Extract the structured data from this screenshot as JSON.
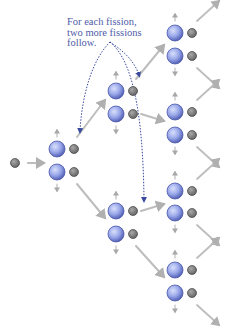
{
  "annotation": {
    "lines": [
      "For each fission,",
      "two more fissions",
      "follow."
    ],
    "color": "#4f5ca8"
  },
  "colors": {
    "nucleus_light": "#c9d3f7",
    "nucleus_mid": "#8e9ee6",
    "nucleus_dark": "#5563b8",
    "neutron_fill": "#7a7a7a",
    "neutron_stroke": "#4a4a4a",
    "arrow": "#b4b4b4",
    "dotted_arrow": "#3a4a9e"
  },
  "diagram": {
    "initial_neutron": {
      "x": 15,
      "y": 163
    },
    "stages": [
      {
        "name": "stage-1",
        "pairs": [
          {
            "x": 57,
            "y1": 149,
            "y2": 172
          }
        ]
      },
      {
        "name": "stage-2",
        "pairs": [
          {
            "x": 116,
            "y1": 91,
            "y2": 114
          },
          {
            "x": 116,
            "y1": 211,
            "y2": 234
          }
        ]
      },
      {
        "name": "stage-3",
        "pairs": [
          {
            "x": 175,
            "y1": 33,
            "y2": 56
          },
          {
            "x": 175,
            "y1": 112,
            "y2": 135
          },
          {
            "x": 175,
            "y1": 191,
            "y2": 213
          },
          {
            "x": 175,
            "y1": 270,
            "y2": 293
          }
        ]
      }
    ]
  }
}
